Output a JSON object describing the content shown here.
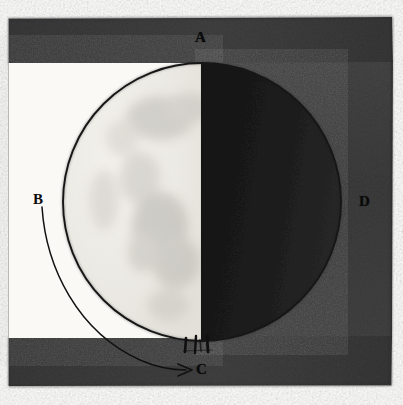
{
  "figure": {
    "width": 403,
    "height": 405
  },
  "labels": {
    "a": "A",
    "b": "B",
    "c": "C",
    "d": "D"
  },
  "colors": {
    "page_background": "#fdfdfb",
    "frame_dark": "#3e3e3e",
    "frame_dark_alt": "#4a4a4a",
    "shadow_half": "#1c1c1c",
    "lit_half": "#eceae4",
    "maria_gray": "#b9b7b2",
    "ink_line": "#141414",
    "inner_white": "#f7f6f2"
  },
  "geometry": {
    "circle_center_x": 202,
    "circle_center_y": 202,
    "circle_radius": 139,
    "terminator_x": 202,
    "frame_left": 8,
    "frame_top": 18,
    "frame_right": 392,
    "frame_bottom": 386,
    "top_band_height": 46,
    "bottom_band_top": 336,
    "white_field_right": 202
  },
  "annotations": {
    "pointer_label": "B",
    "pointer_target": "C",
    "arrow_direction": "right",
    "arrow_tip_x": 192,
    "arrow_tip_y": 370,
    "leader_start_x": 42,
    "leader_start_y": 206,
    "tick_count": 3,
    "tick_description": "three short vertical hatch strokes at the lower limb near point C"
  },
  "points": [
    {
      "id": "A",
      "label": "A",
      "x": 202,
      "y": 38,
      "position": "top of the lunar disc on the terminator",
      "region": "upper dark band"
    },
    {
      "id": "B",
      "label": "B",
      "x": 40,
      "y": 200,
      "position": "left margin, start of the curved leader line",
      "region": "white field"
    },
    {
      "id": "C",
      "label": "C",
      "x": 202,
      "y": 370,
      "position": "bottom of the lunar disc on the terminator",
      "region": "lower dark band"
    },
    {
      "id": "D",
      "label": "D",
      "x": 366,
      "y": 202,
      "position": "right limb of the lunar disc",
      "region": "right dark field"
    }
  ]
}
